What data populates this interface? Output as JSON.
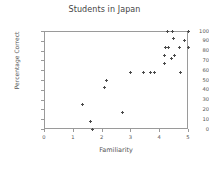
{
  "chart_data": {
    "type": "scatter",
    "title": "Students in Japan",
    "xlabel": "Familiarity",
    "ylabel": "Percentage Correct",
    "xlim": [
      0,
      5
    ],
    "ylim": [
      0,
      100
    ],
    "xticks": [
      0,
      1,
      2,
      3,
      4,
      5
    ],
    "yticks": [
      0,
      10,
      20,
      30,
      40,
      50,
      60,
      70,
      80,
      90,
      100
    ],
    "grid": false,
    "legend": null,
    "marker": "plus",
    "marker_color": "#4a4a4a",
    "points": [
      {
        "x": 1.35,
        "y": 25
      },
      {
        "x": 1.62,
        "y": 8
      },
      {
        "x": 1.7,
        "y": 0
      },
      {
        "x": 2.1,
        "y": 42
      },
      {
        "x": 2.17,
        "y": 50
      },
      {
        "x": 2.72,
        "y": 17
      },
      {
        "x": 3.0,
        "y": 58
      },
      {
        "x": 3.45,
        "y": 58
      },
      {
        "x": 3.7,
        "y": 58
      },
      {
        "x": 3.85,
        "y": 58
      },
      {
        "x": 4.18,
        "y": 75
      },
      {
        "x": 4.2,
        "y": 67
      },
      {
        "x": 4.22,
        "y": 83
      },
      {
        "x": 4.3,
        "y": 100
      },
      {
        "x": 4.33,
        "y": 83
      },
      {
        "x": 4.42,
        "y": 72
      },
      {
        "x": 4.45,
        "y": 100
      },
      {
        "x": 4.5,
        "y": 92
      },
      {
        "x": 4.52,
        "y": 75
      },
      {
        "x": 4.7,
        "y": 83
      },
      {
        "x": 4.75,
        "y": 58
      },
      {
        "x": 4.88,
        "y": 90
      },
      {
        "x": 5.0,
        "y": 100
      },
      {
        "x": 5.0,
        "y": 83
      }
    ]
  }
}
